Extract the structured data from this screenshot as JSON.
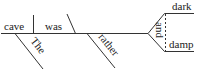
{
  "diagram": {
    "type": "sentence-diagram",
    "sentence_words": {
      "subject": "cave",
      "subject_modifier": "The",
      "verb": "was",
      "adverb_modifier": "rather",
      "conjunction": "and",
      "complement_1": "dark",
      "complement_2": "damp"
    },
    "colors": {
      "line": "#333333",
      "text": "#222222",
      "background": "#ffffff"
    }
  }
}
